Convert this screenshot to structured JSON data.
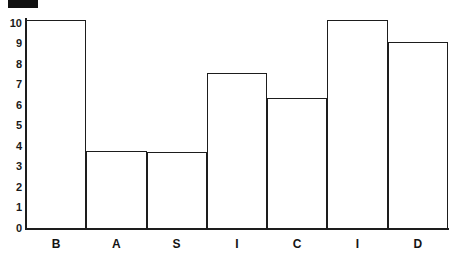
{
  "marker": {
    "name": "black-rectangle-marker",
    "color": "#111111"
  },
  "chart_data": {
    "type": "bar",
    "title": "",
    "subtitle": "",
    "xlabel": "",
    "ylabel": "",
    "categories": [
      "B",
      "A",
      "S",
      "I",
      "C",
      "I",
      "D"
    ],
    "values": [
      10.1,
      3.75,
      3.7,
      7.55,
      6.35,
      10.1,
      9.05
    ],
    "series": [
      {
        "name": "",
        "values": [
          10.1,
          3.75,
          3.7,
          7.55,
          6.35,
          10.1,
          9.05
        ]
      }
    ],
    "ylim": [
      0,
      10.4
    ],
    "yticks": [
      0,
      1,
      2,
      3,
      4,
      5,
      6,
      7,
      8,
      9,
      10
    ],
    "ytick_labels": [
      "0",
      "1",
      "2",
      "3",
      "4",
      "5",
      "6",
      "7",
      "8",
      "9",
      "10"
    ],
    "grid": false,
    "legend": null,
    "legend_position": "none",
    "bar_style": {
      "fill": "#ffffff",
      "edge": "#1d1d1d",
      "edge_width": 1.6,
      "gap": 0
    },
    "axis_color": "#1d1d1d",
    "background": "#ffffff",
    "annotations": []
  }
}
